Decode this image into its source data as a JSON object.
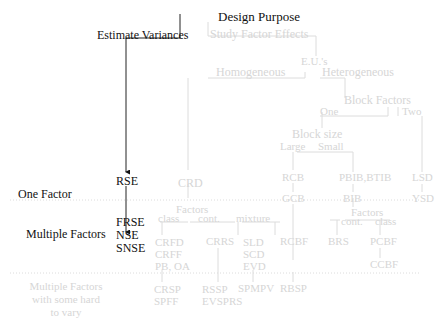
{
  "title": "Design Purpose",
  "purposes": {
    "estimate_variances": "Estimate Variances",
    "study_factor_effects": "Study Factor Effects"
  },
  "eu_node": "E.U.'s",
  "eu_branches": {
    "homogeneous": "Homogeneous",
    "heterogeneous": "Heterogeneous"
  },
  "block_factors": {
    "label": "Block Factors",
    "one": "One",
    "two": "Two"
  },
  "block_size": {
    "label": "Block size",
    "large": "Large",
    "small": "Small"
  },
  "row_labels": {
    "one_factor": "One Factor",
    "multiple_factors": "Multiple Factors",
    "hard_to_vary": [
      "Multiple Factors",
      "with some hard",
      "to vary"
    ]
  },
  "variance_designs": {
    "one_factor": "RSE",
    "multiple": [
      "FRSE",
      "NSE",
      "SNSE"
    ]
  },
  "homogeneous_designs": {
    "one_factor": "CRD",
    "factors_label": "Factors",
    "factor_types": {
      "class": "class",
      "cont": "cont.",
      "mixture": "mixture"
    },
    "class_designs": [
      "CRFD",
      "CRFF",
      "PB, OA"
    ],
    "cont_designs": [
      "CRRS"
    ],
    "mixture_designs": [
      "SLD",
      "SCD",
      "EVD"
    ],
    "hard_to_vary": {
      "class": [
        "CRSP",
        "SPFF"
      ],
      "cont": [
        "RSSP",
        "EVSPRS"
      ],
      "mixture": [
        "SPMPV"
      ]
    }
  },
  "heterogeneous_designs": {
    "large_one_factor": [
      "RCB",
      "GCB"
    ],
    "large_multiple": "RCBF",
    "large_hard_to_vary": "RBSP",
    "small_one_factor": [
      "PBIB,BTIB",
      "BIB"
    ],
    "small_factors_label": "Factors",
    "small_factor_types": {
      "cont": "cont.",
      "class": "class"
    },
    "small_cont_designs": [
      "BRS"
    ],
    "small_class_designs": [
      "PCBF",
      "CCBF"
    ],
    "two_factor": [
      "LSD",
      "YSD"
    ]
  },
  "colors": {
    "active": "#111111",
    "faded": "#d6d6d6"
  }
}
